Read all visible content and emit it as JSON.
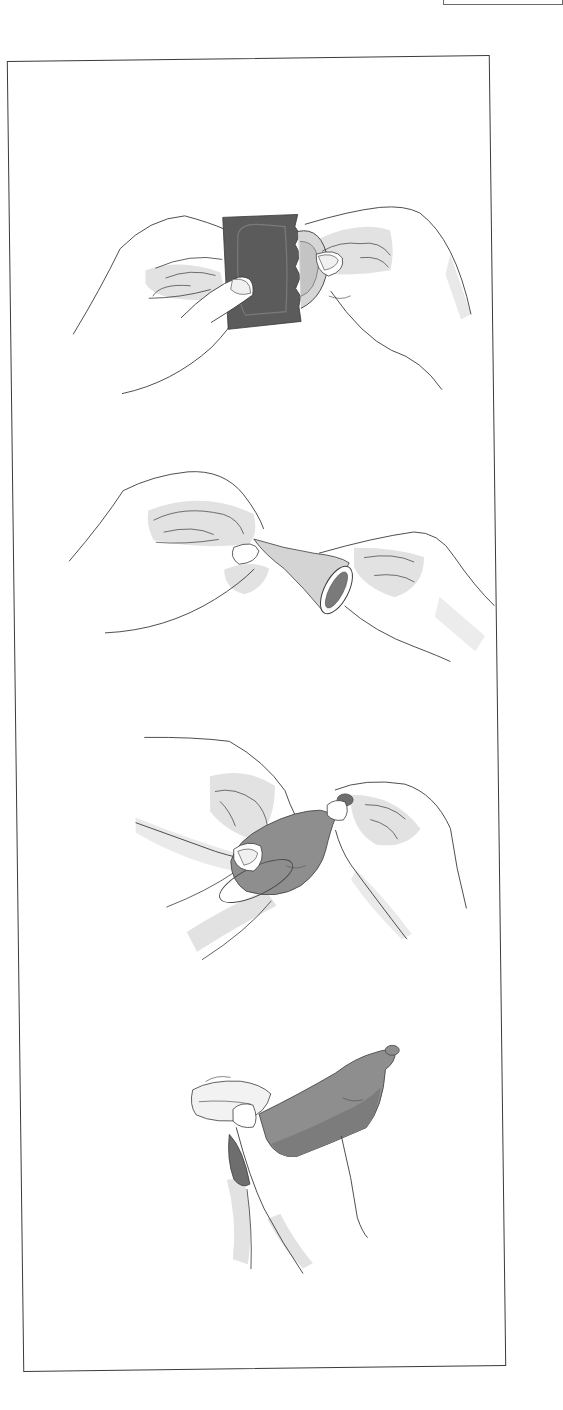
{
  "document": {
    "type": "instructional illustration sheet",
    "frame": {
      "border_color": "#3a3a3a",
      "background": "#ffffff"
    },
    "colors": {
      "outline": "#3c3c3c",
      "skin_shadow": "#e2e2e2",
      "packet": "#5b5b5b",
      "latex_mid": "#8e8e8e",
      "latex_dark": "#6e6e6e",
      "latex_light": "#cfcfcf"
    },
    "steps": [
      {
        "index": 1,
        "illustration": "hands-tearing-packet"
      },
      {
        "index": 2,
        "illustration": "hands-unrolling-check-direction"
      },
      {
        "index": 3,
        "illustration": "pinching-tip-placing"
      },
      {
        "index": 4,
        "illustration": "rolling-down-shaft"
      }
    ]
  }
}
